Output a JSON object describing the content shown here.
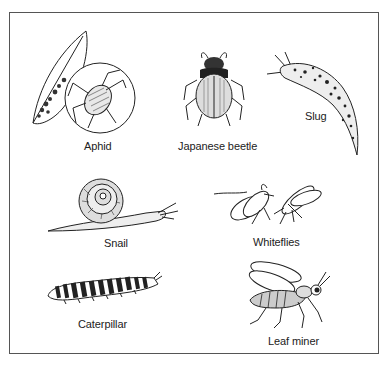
{
  "figure": {
    "type": "illustration",
    "pests": [
      {
        "id": "aphid",
        "label": "Aphid"
      },
      {
        "id": "japanese-beetle",
        "label": "Japanese beetle"
      },
      {
        "id": "slug",
        "label": "Slug"
      },
      {
        "id": "snail",
        "label": "Snail"
      },
      {
        "id": "whiteflies",
        "label": "Whiteflies"
      },
      {
        "id": "caterpillar",
        "label": "Caterpillar"
      },
      {
        "id": "leaf-miner",
        "label": "Leaf miner"
      }
    ]
  },
  "colors": {
    "ink": "#222222",
    "border": "#555555",
    "background": "#ffffff"
  }
}
